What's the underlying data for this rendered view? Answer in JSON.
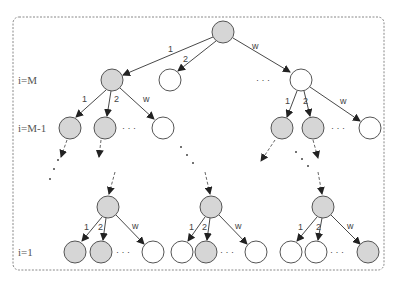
{
  "diagram": {
    "type": "tree",
    "frame": {
      "x": 13,
      "y": 17,
      "w": 371,
      "h": 253,
      "style": "dashed-rounded"
    },
    "colors": {
      "gray_node": "#d6d6d6",
      "white_node": "#ffffff",
      "stroke": "#555555",
      "border": "#888888"
    },
    "level_labels": [
      {
        "text": "i=M",
        "y": 80
      },
      {
        "text": "i=M-1",
        "y": 128
      },
      {
        "text": "i=1",
        "y": 252
      }
    ],
    "edge_labels": {
      "first": "1",
      "second": "2",
      "last": "w"
    },
    "ellipsis": "· · ·",
    "nodes": [
      {
        "id": "root",
        "x": 223,
        "y": 32,
        "fill": "gray"
      },
      {
        "id": "m1",
        "x": 112,
        "y": 80,
        "fill": "gray"
      },
      {
        "id": "m2",
        "x": 170,
        "y": 80,
        "fill": "white"
      },
      {
        "id": "mw",
        "x": 301,
        "y": 80,
        "fill": "white"
      },
      {
        "id": "m1c1",
        "x": 70,
        "y": 128,
        "fill": "gray"
      },
      {
        "id": "m1c2",
        "x": 105,
        "y": 128,
        "fill": "gray"
      },
      {
        "id": "m1cw",
        "x": 163,
        "y": 128,
        "fill": "white"
      },
      {
        "id": "mwc1",
        "x": 282,
        "y": 128,
        "fill": "gray"
      },
      {
        "id": "mwc2",
        "x": 313,
        "y": 128,
        "fill": "gray"
      },
      {
        "id": "mwcw",
        "x": 370,
        "y": 128,
        "fill": "white"
      },
      {
        "id": "a",
        "x": 108,
        "y": 207,
        "fill": "gray"
      },
      {
        "id": "a1",
        "x": 75,
        "y": 252,
        "fill": "gray"
      },
      {
        "id": "a2",
        "x": 101,
        "y": 252,
        "fill": "gray"
      },
      {
        "id": "aw",
        "x": 153,
        "y": 252,
        "fill": "white"
      },
      {
        "id": "b",
        "x": 211,
        "y": 207,
        "fill": "gray"
      },
      {
        "id": "b1",
        "x": 182,
        "y": 252,
        "fill": "white"
      },
      {
        "id": "b2",
        "x": 206,
        "y": 252,
        "fill": "gray"
      },
      {
        "id": "bw",
        "x": 256,
        "y": 252,
        "fill": "white"
      },
      {
        "id": "c",
        "x": 323,
        "y": 207,
        "fill": "gray"
      },
      {
        "id": "c1",
        "x": 291,
        "y": 252,
        "fill": "white"
      },
      {
        "id": "c2",
        "x": 316,
        "y": 252,
        "fill": "white"
      },
      {
        "id": "cw",
        "x": 368,
        "y": 252,
        "fill": "gray"
      }
    ]
  }
}
